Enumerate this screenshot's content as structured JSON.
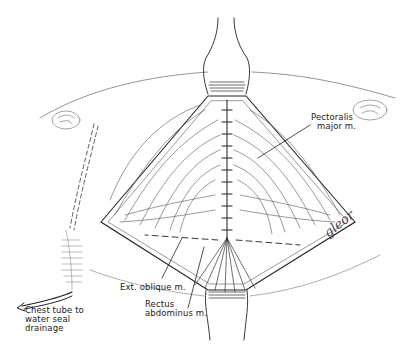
{
  "figure": {
    "type": "surgical illustration",
    "colors": {
      "ink": "#222222",
      "background": "#ffffff",
      "hatch": "#555555"
    }
  },
  "labels": {
    "pectoralis": [
      "Pectoralis",
      "major m."
    ],
    "ext_oblique": "Ext. oblique m.",
    "rectus": [
      "Rectus",
      "abdominus m."
    ],
    "chest_tube": [
      "Chest tube to",
      "water seal",
      "drainage"
    ]
  },
  "signature": "gleor"
}
